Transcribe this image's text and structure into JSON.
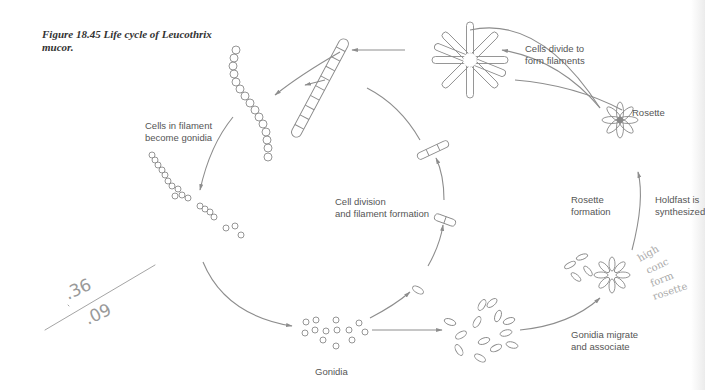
{
  "figure": {
    "caption_line1": "Figure 18.45   Life cycle of Leucothrix",
    "caption_line2": "mucor."
  },
  "stages": {
    "filaments_become_gonidia": {
      "line1": "Cells in filament",
      "line2": "become gonidia"
    },
    "cell_division": {
      "line1": "Cell division",
      "line2": "and filament formation"
    },
    "gonidia": {
      "label": "Gonidia"
    },
    "gonidia_migrate": {
      "line1": "Gonidia migrate",
      "line2": "and associate"
    },
    "rosette_formation": {
      "line1": "Rosette",
      "line2": "formation"
    },
    "holdfast": {
      "line1": "Holdfast is",
      "line2": "synthesized"
    },
    "rosette": {
      "label": "Rosette"
    },
    "cells_divide": {
      "line1": "Cells divide to",
      "line2": "form filaments"
    }
  },
  "handwriting": {
    "fraction_numerator": ".36",
    "fraction_denominator": ".09",
    "margin_note": [
      "high",
      "conc",
      "form",
      "rosette"
    ]
  },
  "colors": {
    "line": "#8d8d8d",
    "text": "#555555",
    "caption": "#333333"
  }
}
